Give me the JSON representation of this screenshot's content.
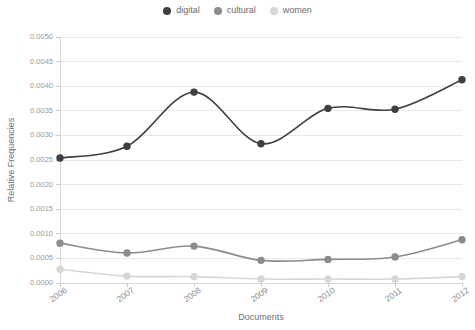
{
  "chart_data": {
    "type": "line",
    "title": "",
    "xlabel": "Documents",
    "ylabel": "Relative Frequencies",
    "categories": [
      "2006",
      "2007",
      "2008",
      "2009",
      "2010",
      "2011",
      "2012"
    ],
    "x": [
      2006,
      2007,
      2008,
      2009,
      2010,
      2011,
      2012
    ],
    "series": [
      {
        "name": "digital",
        "color": "#3f3f3f",
        "values": [
          0.00254,
          0.00278,
          0.00388,
          0.00283,
          0.00355,
          0.00353,
          0.00413
        ]
      },
      {
        "name": "cultural",
        "color": "#8c8c8c",
        "values": [
          0.00081,
          0.00061,
          0.00075,
          0.00046,
          0.00048,
          0.00053,
          0.00088
        ]
      },
      {
        "name": "women",
        "color": "#d6d6d6",
        "values": [
          0.00028,
          0.00014,
          0.00013,
          8e-05,
          8e-05,
          8e-05,
          0.00013
        ]
      }
    ],
    "ylim": [
      0.0,
      0.005
    ],
    "ytick_values": [
      0.0,
      0.0005,
      0.001,
      0.0015,
      0.002,
      0.0025,
      0.003,
      0.0035,
      0.004,
      0.0045,
      0.005
    ],
    "ytick_labels": [
      "0.0000",
      "0.0005",
      "0.0010",
      "0.0015",
      "0.0020",
      "0.0025",
      "0.0030",
      "0.0035",
      "0.0040",
      "0.0045",
      "0.0050"
    ],
    "grid": true,
    "grid_axis": "y",
    "legend_position": "top-center",
    "xtick_rotation": -35,
    "smoothing": "spline"
  },
  "legend": {
    "items": [
      {
        "label": "digital",
        "color": "#3f3f3f"
      },
      {
        "label": "cultural",
        "color": "#8c8c8c"
      },
      {
        "label": "women",
        "color": "#d6d6d6"
      }
    ]
  },
  "axes": {
    "x_title": "Documents",
    "y_title": "Relative Frequencies"
  },
  "colors": {
    "background": "#ffffff",
    "grid": "#e9e9e9",
    "axis": "#d8d8d8",
    "text": "#8f8f8f"
  }
}
